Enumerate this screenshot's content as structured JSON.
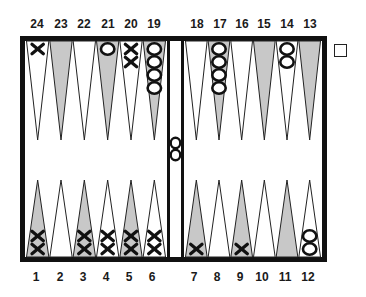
{
  "board": {
    "top_labels_left": [
      "24",
      "23",
      "22",
      "21",
      "20",
      "19"
    ],
    "top_labels_right": [
      "18",
      "17",
      "16",
      "15",
      "14",
      "13"
    ],
    "bottom_labels_left": [
      "1",
      "2",
      "3",
      "4",
      "5",
      "6"
    ],
    "bottom_labels_right": [
      "7",
      "8",
      "9",
      "10",
      "11",
      "12"
    ],
    "colors": {
      "frame": "#111111",
      "shaded_point": "#c8c8c8",
      "white_point": "#ffffff",
      "checker_stroke": "#111111"
    },
    "points": [
      {
        "point": 1,
        "shaded": true,
        "player": "X",
        "count": 2
      },
      {
        "point": 2,
        "shaded": false,
        "player": null,
        "count": 0
      },
      {
        "point": 3,
        "shaded": true,
        "player": "X",
        "count": 2
      },
      {
        "point": 4,
        "shaded": false,
        "player": "X",
        "count": 2
      },
      {
        "point": 5,
        "shaded": true,
        "player": "X",
        "count": 2
      },
      {
        "point": 6,
        "shaded": false,
        "player": "X",
        "count": 2
      },
      {
        "point": 7,
        "shaded": true,
        "player": "X",
        "count": 1
      },
      {
        "point": 8,
        "shaded": false,
        "player": null,
        "count": 0
      },
      {
        "point": 9,
        "shaded": true,
        "player": "X",
        "count": 1
      },
      {
        "point": 10,
        "shaded": false,
        "player": null,
        "count": 0
      },
      {
        "point": 11,
        "shaded": true,
        "player": null,
        "count": 0
      },
      {
        "point": 12,
        "shaded": false,
        "player": "O",
        "count": 2
      },
      {
        "point": 13,
        "shaded": true,
        "player": null,
        "count": 0
      },
      {
        "point": 14,
        "shaded": false,
        "player": "O",
        "count": 2
      },
      {
        "point": 15,
        "shaded": true,
        "player": null,
        "count": 0
      },
      {
        "point": 16,
        "shaded": false,
        "player": null,
        "count": 0
      },
      {
        "point": 17,
        "shaded": true,
        "player": "O",
        "count": 4
      },
      {
        "point": 18,
        "shaded": false,
        "player": null,
        "count": 0
      },
      {
        "point": 19,
        "shaded": true,
        "player": "O",
        "count": 4
      },
      {
        "point": 20,
        "shaded": false,
        "player": "X",
        "count": 2
      },
      {
        "point": 21,
        "shaded": true,
        "player": "O",
        "count": 1
      },
      {
        "point": 22,
        "shaded": false,
        "player": null,
        "count": 0
      },
      {
        "point": 23,
        "shaded": true,
        "player": null,
        "count": 0
      },
      {
        "point": 24,
        "shaded": false,
        "player": "X",
        "count": 1
      }
    ],
    "bar": {
      "player": "O",
      "count": 2
    },
    "doubling_cube": {
      "value": ""
    }
  }
}
